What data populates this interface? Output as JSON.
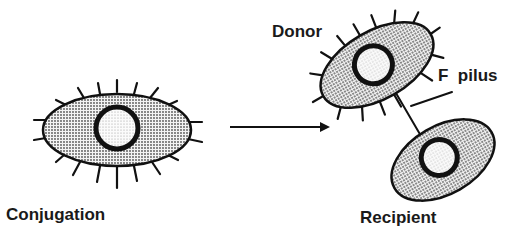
{
  "labels": {
    "conjugation": "Conjugation",
    "donor": "Donor",
    "f_pilus": "F  pilus",
    "recipient": "Recipient"
  },
  "colors": {
    "ink": "#111111",
    "cell_fill": "#bdbdbd",
    "nucleus_fill": "#e6e6e6",
    "background": "#ffffff"
  }
}
